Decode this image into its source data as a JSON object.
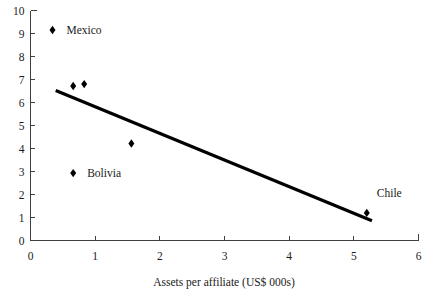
{
  "chart_data": {
    "type": "scatter",
    "title": "",
    "subtitle": "",
    "xlabel": "Assets per affiliate (US$ 000s)",
    "ylabel": "",
    "xlim": [
      0,
      6
    ],
    "ylim": [
      0,
      10
    ],
    "xticks": [
      0,
      1,
      2,
      3,
      4,
      5,
      6
    ],
    "yticks": [
      0,
      1,
      2,
      3,
      4,
      5,
      6,
      7,
      8,
      9,
      10
    ],
    "xtick_labels": [
      "0",
      "1",
      "2",
      "3",
      "4",
      "5",
      "6"
    ],
    "ytick_labels": [
      "0",
      "1",
      "2",
      "3",
      "4",
      "5",
      "6",
      "7",
      "8",
      "9",
      "10"
    ],
    "grid": false,
    "legend": "none",
    "marker_shape": "diamond",
    "marker_color": "#000000",
    "points": [
      {
        "label": "Mexico",
        "x": 0.34,
        "y": 9.15,
        "label_dx": 14,
        "label_dy": 4
      },
      {
        "label": "",
        "x": 0.66,
        "y": 6.72,
        "label_dx": 0,
        "label_dy": 0
      },
      {
        "label": "",
        "x": 0.83,
        "y": 6.8,
        "label_dx": 0,
        "label_dy": 0
      },
      {
        "label": "",
        "x": 1.56,
        "y": 4.22,
        "label_dx": 0,
        "label_dy": 0
      },
      {
        "label": "Bolivia",
        "x": 0.66,
        "y": 2.93,
        "label_dx": 14,
        "label_dy": 4
      },
      {
        "label": "Chile",
        "x": 5.2,
        "y": 1.2,
        "label_dx": 10,
        "label_dy": -16
      }
    ],
    "trendline": {
      "type": "linear",
      "x_start": 0.39,
      "y_start": 6.52,
      "x_end": 5.28,
      "y_end": 0.86,
      "color": "#000000",
      "width": 3.2
    }
  }
}
